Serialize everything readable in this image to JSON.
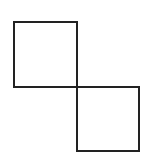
{
  "diagram": {
    "stroke_color": "#222222",
    "stroke_width": 2,
    "fill_color": "none",
    "background": "#ffffff",
    "shapes": [
      {
        "id": "square-top-left",
        "type": "rect",
        "x": 14,
        "y": 22,
        "width": 63,
        "height": 65
      },
      {
        "id": "square-bottom-right",
        "type": "rect",
        "x": 77,
        "y": 87,
        "width": 62,
        "height": 64
      }
    ],
    "shared_vertex": {
      "x": 77,
      "y": 87
    }
  }
}
